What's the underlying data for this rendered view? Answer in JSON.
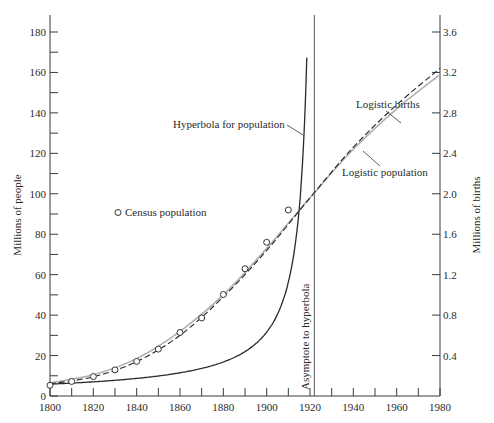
{
  "chart_data": {
    "type": "line",
    "title": "",
    "xlabel": "",
    "ylabel": "Millions of people",
    "y2label": "Millions of births",
    "xlim": [
      1800,
      1980
    ],
    "ylim": [
      0,
      190
    ],
    "y2lim": [
      0,
      3.8
    ],
    "x_ticks": [
      1800,
      1820,
      1840,
      1860,
      1880,
      1900,
      1920,
      1940,
      1960,
      1980
    ],
    "x_minor_ticks": [
      1810,
      1830,
      1850,
      1870,
      1890,
      1910,
      1930,
      1950,
      1970
    ],
    "y_ticks": [
      0,
      20,
      40,
      60,
      80,
      100,
      120,
      140,
      160,
      180
    ],
    "y2_ticks": [
      0.4,
      0.8,
      1.2,
      1.6,
      2.0,
      2.4,
      2.8,
      3.2,
      3.6
    ],
    "grid": false,
    "legend": "inline annotations",
    "series": [
      {
        "name": "Census population",
        "style": "open-circle markers",
        "x": [
          1800,
          1810,
          1820,
          1830,
          1840,
          1850,
          1860,
          1870,
          1880,
          1890,
          1900,
          1910
        ],
        "values": [
          5.3,
          7.2,
          9.6,
          12.9,
          17.1,
          23.2,
          31.4,
          38.6,
          50.2,
          62.9,
          76.0,
          92.0
        ]
      },
      {
        "name": "Hyperbola for population",
        "style": "solid dark",
        "x": [
          1800,
          1820,
          1840,
          1860,
          1870,
          1880,
          1890,
          1900,
          1905,
          1910,
          1915,
          1918,
          1920.5
        ],
        "values": [
          5.5,
          8.0,
          12.0,
          23.0,
          29.0,
          41.0,
          56.0,
          76.0,
          93.0,
          118.0,
          150.0,
          175.0,
          190.0
        ]
      },
      {
        "name": "Logistic population",
        "style": "solid light gray",
        "x": [
          1800,
          1820,
          1840,
          1860,
          1880,
          1900,
          1920,
          1940,
          1960,
          1980
        ],
        "values": [
          6.5,
          10.5,
          18.5,
          32.0,
          50.0,
          73.0,
          98.0,
          122.0,
          142.0,
          159.0
        ]
      },
      {
        "name": "Logistic births",
        "style": "dashed dark",
        "axis": "right",
        "x": [
          1800,
          1820,
          1840,
          1860,
          1880,
          1900,
          1920,
          1940,
          1960,
          1980
        ],
        "values": [
          0.12,
          0.19,
          0.34,
          0.6,
          0.98,
          1.44,
          1.96,
          2.46,
          2.88,
          3.24
        ]
      }
    ],
    "annotations": [
      {
        "text": "Hyperbola for population",
        "arrow_to": [
          1915,
          145
        ]
      },
      {
        "text": "Census population",
        "marker": "open-circle"
      },
      {
        "text": "Logistic births",
        "arrow_to": [
          1940,
          125
        ]
      },
      {
        "text": "Logistic population",
        "arrow_to": [
          1940,
          121
        ]
      },
      {
        "text": "Asymptote to hyperbola",
        "vertical_line_x": 1922
      }
    ]
  },
  "labels": {
    "y_axis_title": "Millions of people",
    "y2_axis_title": "Millions of births",
    "hyperbola": "Hyperbola for population",
    "census": "Census population",
    "logistic_births": "Logistic births",
    "logistic_population": "Logistic population",
    "asymptote": "Asymptote to hyperbola"
  }
}
